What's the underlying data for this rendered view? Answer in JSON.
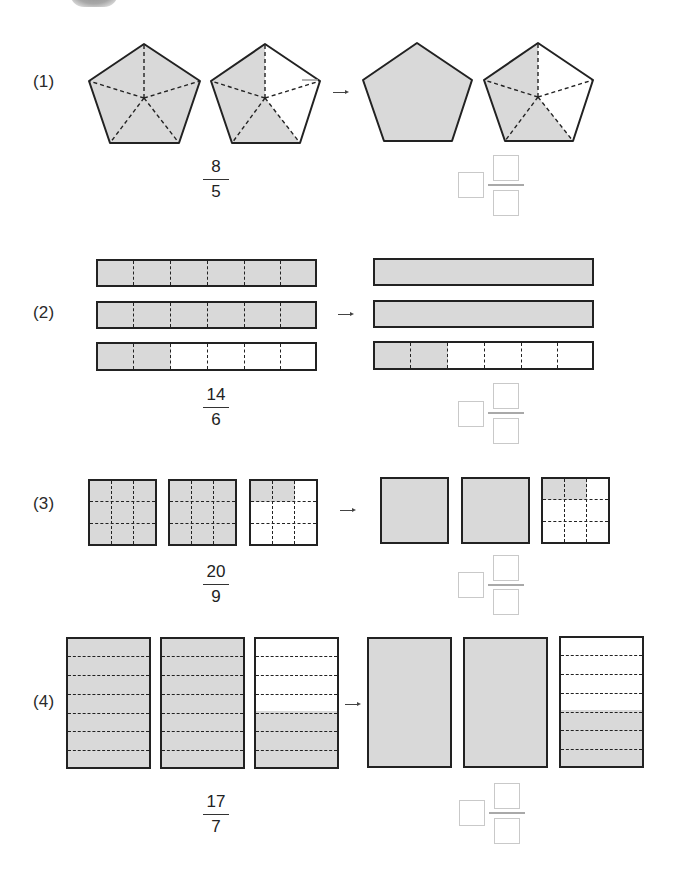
{
  "colors": {
    "shade": "#d9d9d9",
    "outline": "#222222",
    "answer_box_border": "#c9c9c9"
  },
  "problems": [
    {
      "label": "(1)",
      "shape": "pentagon",
      "parts_per_whole": 5,
      "fraction": {
        "numerator": "8",
        "denominator": "5"
      },
      "left_shapes_shaded_parts": [
        5,
        3
      ],
      "right_shapes": [
        "whole-filled",
        "3-of-5-shaded"
      ],
      "arrow": "→",
      "answer": {
        "whole": "",
        "numerator": "",
        "denominator": ""
      }
    },
    {
      "label": "(2)",
      "shape": "bar",
      "parts_per_whole": 6,
      "fraction": {
        "numerator": "14",
        "denominator": "6"
      },
      "left_shapes_shaded_parts": [
        6,
        6,
        2
      ],
      "right_shapes": [
        "whole-filled",
        "whole-filled",
        "2-of-6-shaded"
      ],
      "arrow": "→",
      "answer": {
        "whole": "",
        "numerator": "",
        "denominator": ""
      }
    },
    {
      "label": "(3)",
      "shape": "square-3x3",
      "parts_per_whole": 9,
      "fraction": {
        "numerator": "20",
        "denominator": "9"
      },
      "left_shapes_shaded_parts": [
        9,
        9,
        2
      ],
      "right_shapes": [
        "whole-filled",
        "whole-filled",
        "2-of-9-shaded"
      ],
      "arrow": "→",
      "answer": {
        "whole": "",
        "numerator": "",
        "denominator": ""
      }
    },
    {
      "label": "(4)",
      "shape": "rectangle-7-rows",
      "parts_per_whole": 7,
      "fraction": {
        "numerator": "17",
        "denominator": "7"
      },
      "left_shapes_shaded_parts": [
        7,
        7,
        3
      ],
      "right_shapes": [
        "whole-filled",
        "whole-filled",
        "3-of-7-shaded"
      ],
      "arrow": "→",
      "answer": {
        "whole": "",
        "numerator": "",
        "denominator": ""
      }
    }
  ]
}
